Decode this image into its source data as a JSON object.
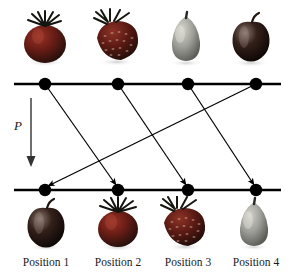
{
  "figure": {
    "background_color": "#ffffff",
    "width": 295,
    "height": 278
  },
  "permutation_label": {
    "text": "P",
    "style": "italic-serif",
    "arrow_direction": "down"
  },
  "axis_lines": {
    "color": "#000000",
    "top_line_y": 84,
    "bottom_line_y": 190,
    "x_start": 14,
    "x_end": 281,
    "stroke_width": 2.4
  },
  "nodes": {
    "color": "#000000",
    "radius": 6,
    "x_positions": [
      45,
      118,
      188,
      256
    ],
    "top_y": 84,
    "bottom_y": 190,
    "top_labels": [
      "top-node-1",
      "top-node-2",
      "top-node-3",
      "top-node-4"
    ],
    "bottom_labels": [
      "bottom-node-1",
      "bottom-node-2",
      "bottom-node-3",
      "bottom-node-4"
    ]
  },
  "mapping": {
    "description": "Each top node maps to a bottom node via an arrow",
    "edges": [
      {
        "from": 1,
        "to": 2
      },
      {
        "from": 2,
        "to": 3
      },
      {
        "from": 3,
        "to": 4
      },
      {
        "from": 4,
        "to": 1
      }
    ],
    "arrow_color": "#000000",
    "arrow_stroke_width": 1.1
  },
  "top_row": {
    "items": [
      {
        "position": 1,
        "fruit": "tomato",
        "color": "#6e1f18",
        "highlight": "#a8483a"
      },
      {
        "position": 2,
        "fruit": "strawberry",
        "color": "#5d1a16",
        "highlight": "#8f3a30"
      },
      {
        "position": 3,
        "fruit": "lemon",
        "color": "#9a9a94",
        "highlight": "#c8c8c2"
      },
      {
        "position": 4,
        "fruit": "apple",
        "color": "#2a1410",
        "highlight": "#6b5a52"
      }
    ]
  },
  "bottom_row": {
    "items": [
      {
        "position": 1,
        "fruit": "apple",
        "color": "#2a1410",
        "highlight": "#6b5a52"
      },
      {
        "position": 2,
        "fruit": "tomato",
        "color": "#6e1f18",
        "highlight": "#a8483a"
      },
      {
        "position": 3,
        "fruit": "strawberry",
        "color": "#5d1a16",
        "highlight": "#8f3a30"
      },
      {
        "position": 4,
        "fruit": "lemon",
        "color": "#9a9a94",
        "highlight": "#c8c8c2"
      }
    ]
  },
  "position_labels": {
    "items": [
      {
        "text": "Position 1"
      },
      {
        "text": "Position 2"
      },
      {
        "text": "Position 3"
      },
      {
        "text": "Position 4"
      }
    ]
  }
}
